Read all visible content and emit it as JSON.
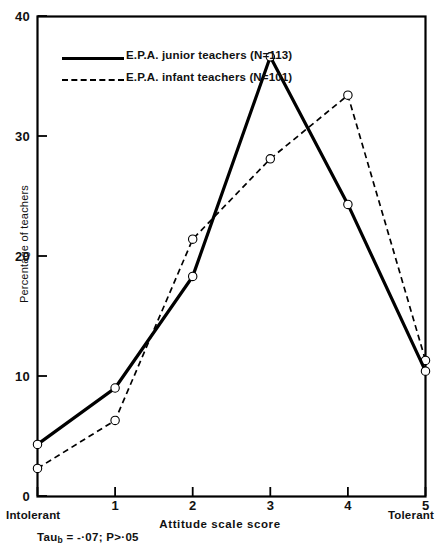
{
  "chart_data": {
    "type": "line",
    "title": "",
    "xlabel": "Attitude scale score",
    "ylabel": "Percentage of teachers",
    "x": [
      0,
      1,
      2,
      3,
      4,
      5
    ],
    "xlim": [
      0,
      5
    ],
    "ylim": [
      0,
      40
    ],
    "xticks": [
      "0",
      "1",
      "2",
      "3",
      "4",
      "5"
    ],
    "yticks": [
      "0",
      "10",
      "20",
      "30",
      "40"
    ],
    "grid": false,
    "legend_position": "upper-left",
    "series": [
      {
        "name": "E.P.A. junior teachers (N=113)",
        "style": "solid",
        "marker": "open-circle",
        "values": [
          4.3,
          9.0,
          18.3,
          36.6,
          24.3,
          10.4
        ]
      },
      {
        "name": "E.P.A. infant teachers (N=101)",
        "style": "dashed",
        "marker": "open-circle",
        "values": [
          2.3,
          6.3,
          21.4,
          28.1,
          33.4,
          11.3
        ]
      }
    ],
    "annotations": {
      "x_low_pole": "Intolerant",
      "x_high_pole": "Tolerant",
      "statistic": "Tau",
      "statistic_subscript": "b",
      "statistic_text": " = -·07; P>·05"
    }
  },
  "legend": {
    "items": [
      {
        "label": "E.P.A. junior teachers (N=113)",
        "style": "solid"
      },
      {
        "label": "E.P.A. infant teachers (N=101)",
        "style": "dashed"
      }
    ]
  },
  "colors": {
    "line": "#000000",
    "axis": "#000000",
    "background": "#ffffff"
  }
}
